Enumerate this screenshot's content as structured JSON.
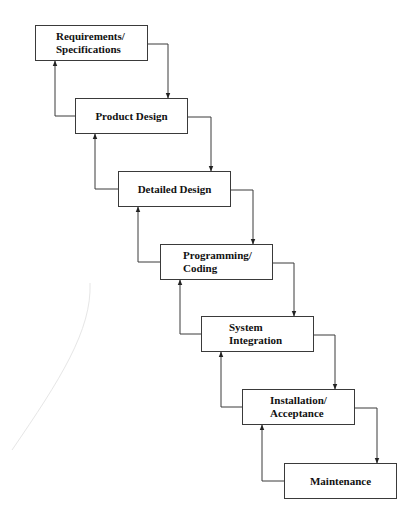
{
  "diagram": {
    "type": "waterfall-model",
    "stages": [
      {
        "id": "requirements",
        "lines": [
          "Requirements/",
          "Specifications"
        ],
        "x": 35,
        "y": 25,
        "align": "left",
        "pad": 20
      },
      {
        "id": "product-design",
        "lines": [
          "Product Design"
        ],
        "x": 75,
        "y": 98,
        "align": "center",
        "pad": 0
      },
      {
        "id": "detailed-design",
        "lines": [
          "Detailed Design"
        ],
        "x": 118,
        "y": 171,
        "align": "center",
        "pad": 0
      },
      {
        "id": "programming",
        "lines": [
          "Programming/",
          "Coding"
        ],
        "x": 160,
        "y": 244,
        "align": "left",
        "pad": 22
      },
      {
        "id": "system-integration",
        "lines": [
          "System",
          "Integration"
        ],
        "x": 201,
        "y": 316,
        "align": "left",
        "pad": 27
      },
      {
        "id": "installation",
        "lines": [
          "Installation/",
          "Acceptance"
        ],
        "x": 242,
        "y": 389,
        "align": "left",
        "pad": 27
      },
      {
        "id": "maintenance",
        "lines": [
          "Maintenance"
        ],
        "x": 284,
        "y": 463,
        "align": "center",
        "pad": 0
      }
    ],
    "box_size": {
      "w": 113,
      "h": 36
    },
    "colors": {
      "line": "#3a3a3a",
      "text": "#111111",
      "artifact": "#e4e4e4"
    }
  }
}
